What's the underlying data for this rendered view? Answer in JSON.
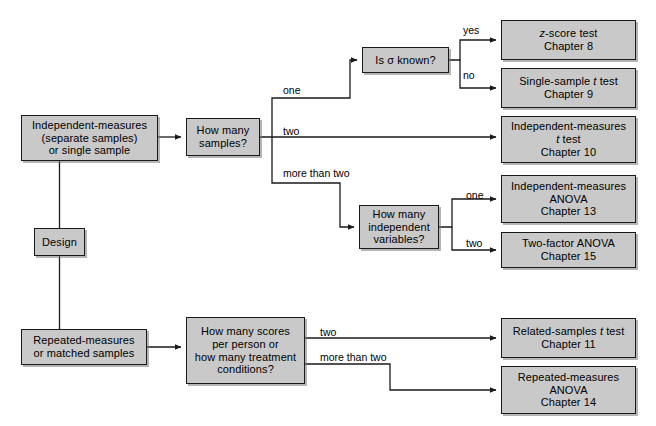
{
  "figure": {
    "kind": "flowchart",
    "title_visible": false,
    "background_color": "#ffffff",
    "node_fill_color": "#c9c9c9",
    "node_border_color": "#1a1a1a",
    "edge_color": "#1a1a1a"
  },
  "nodes": [
    {
      "id": "design",
      "name": "design-node",
      "text": "Design",
      "x": 34,
      "y": 228,
      "w": 51,
      "h": 28,
      "font_size": 11
    },
    {
      "id": "independent-measures",
      "name": "independent-measures-node",
      "text": "Independent-measures\n(separate samples)\nor single sample",
      "x": 21,
      "y": 115,
      "w": 137,
      "h": 46,
      "font_size": 11
    },
    {
      "id": "repeated-measures",
      "name": "repeated-measures-node",
      "text": "Repeated-measures\nor matched samples",
      "x": 21,
      "y": 329,
      "w": 126,
      "h": 36,
      "font_size": 11
    },
    {
      "id": "how-many-samples",
      "name": "how-many-samples-node",
      "text": "How many\nsamples?",
      "x": 186,
      "y": 118,
      "w": 74,
      "h": 38,
      "font_size": 11
    },
    {
      "id": "is-sigma-known",
      "name": "is-sigma-known-node",
      "text": "Is σ known?",
      "x": 362,
      "y": 47,
      "w": 87,
      "h": 26,
      "font_size": 11
    },
    {
      "id": "how-many-iv",
      "name": "how-many-independent-variables-node",
      "text": "How many\nindependent\nvariables?",
      "x": 359,
      "y": 205,
      "w": 80,
      "h": 44,
      "font_size": 11
    },
    {
      "id": "how-many-scores",
      "name": "how-many-scores-node",
      "text": "How many scores\nper person or\nhow many treatment\nconditions?",
      "x": 186,
      "y": 317,
      "w": 119,
      "h": 67,
      "font_size": 11
    },
    {
      "id": "z-score-test",
      "name": "z-score-test-node",
      "text": "z-score test\nChapter 8",
      "x": 501,
      "y": 20,
      "w": 135,
      "h": 40,
      "font_size": 11,
      "italic_first_char": true
    },
    {
      "id": "single-sample-t",
      "name": "single-sample-t-test-node",
      "text": "Single-sample t test\nChapter 9",
      "x": 501,
      "y": 68,
      "w": 135,
      "h": 40,
      "font_size": 11
    },
    {
      "id": "independent-measures-t",
      "name": "independent-measures-t-test-node",
      "text": "Independent-measures\nt test\nChapter 10",
      "x": 501,
      "y": 116,
      "w": 135,
      "h": 47,
      "font_size": 11
    },
    {
      "id": "independent-measures-anova",
      "name": "independent-measures-anova-node",
      "text": "Independent-measures\nANOVA\nChapter 13",
      "x": 501,
      "y": 175,
      "w": 135,
      "h": 48,
      "font_size": 11
    },
    {
      "id": "two-factor-anova",
      "name": "two-factor-anova-node",
      "text": "Two-factor ANOVA\nChapter 15",
      "x": 501,
      "y": 232,
      "w": 135,
      "h": 36,
      "font_size": 11
    },
    {
      "id": "related-samples-t",
      "name": "related-samples-t-test-node",
      "text": "Related-samples t test\nChapter 11",
      "x": 501,
      "y": 318,
      "w": 135,
      "h": 40,
      "font_size": 11
    },
    {
      "id": "repeated-measures-anova",
      "name": "repeated-measures-anova-node",
      "text": "Repeated-measures\nANOVA\nChapter 14",
      "x": 501,
      "y": 366,
      "w": 135,
      "h": 48,
      "font_size": 11
    }
  ],
  "edge_labels": [
    {
      "id": "lbl-one-samples",
      "name": "edge-label-one",
      "text": "one",
      "x": 283,
      "y": 85
    },
    {
      "id": "lbl-two-samples",
      "name": "edge-label-two",
      "text": "two",
      "x": 283,
      "y": 126
    },
    {
      "id": "lbl-more-two",
      "name": "edge-label-more-than-two",
      "text": "more than two",
      "x": 283,
      "y": 168
    },
    {
      "id": "lbl-yes",
      "name": "edge-label-yes",
      "text": "yes",
      "x": 463,
      "y": 25
    },
    {
      "id": "lbl-no",
      "name": "edge-label-no",
      "text": "no",
      "x": 463,
      "y": 70
    },
    {
      "id": "lbl-iv-one",
      "name": "edge-label-iv-one",
      "text": "one",
      "x": 466,
      "y": 190
    },
    {
      "id": "lbl-iv-two",
      "name": "edge-label-iv-two",
      "text": "two",
      "x": 466,
      "y": 238
    },
    {
      "id": "lbl-rm-two",
      "name": "edge-label-rm-two",
      "text": "two",
      "x": 320,
      "y": 327
    },
    {
      "id": "lbl-rm-more-two",
      "name": "edge-label-rm-more-than-two",
      "text": "more than two",
      "x": 320,
      "y": 352
    }
  ],
  "edges": [
    {
      "name": "edge-design-to-independent-measures",
      "path": "M 59.5 228 L 59.5 161"
    },
    {
      "name": "edge-design-to-repeated-measures",
      "path": "M 59.5 256 L 59.5 329"
    },
    {
      "name": "edge-independent-to-how-many-samples",
      "path": "M 158 137 L 181 137",
      "arrow": true
    },
    {
      "name": "edge-samples-to-one",
      "path": "M 260 137 L 272 137 L 272 98 L 350 98 L 350 60 L 357 60",
      "arrow": true
    },
    {
      "name": "edge-samples-to-two",
      "path": "M 272 137 L 496 137",
      "arrow": true
    },
    {
      "name": "edge-samples-to-more-than-two",
      "path": "M 272 137 L 272 183 L 340 183 L 340 227 L 354 227",
      "arrow": true
    },
    {
      "name": "edge-sigma-to-yes",
      "path": "M 449 60 L 460 60 L 460 40 L 496 40",
      "arrow": true
    },
    {
      "name": "edge-sigma-to-no",
      "path": "M 460 60 L 460 88 L 496 88",
      "arrow": true
    },
    {
      "name": "edge-iv-to-one",
      "path": "M 439 227 L 452 227 L 452 199 L 496 199",
      "arrow": true
    },
    {
      "name": "edge-iv-to-two",
      "path": "M 452 227 L 452 250 L 496 250",
      "arrow": true
    },
    {
      "name": "edge-repeated-to-scores",
      "path": "M 147 347 L 181 347",
      "arrow": true
    },
    {
      "name": "edge-scores-to-two",
      "path": "M 305 338 L 496 338",
      "arrow": true
    },
    {
      "name": "edge-scores-to-more-than-two",
      "path": "M 305 364 L 390 364 L 390 390 L 496 390",
      "arrow": true
    }
  ]
}
